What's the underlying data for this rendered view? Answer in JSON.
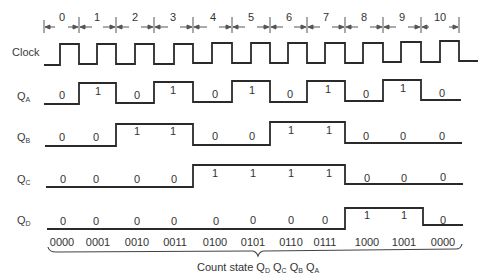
{
  "diagram": {
    "type": "timing-diagram",
    "title": "",
    "signals": {
      "clock": {
        "label": "Clock"
      },
      "qa": {
        "label": "Q",
        "sub": "A",
        "values": [
          "0",
          "1",
          "0",
          "1",
          "0",
          "1",
          "0",
          "1",
          "0",
          "1",
          "0"
        ]
      },
      "qb": {
        "label": "Q",
        "sub": "B",
        "values": [
          "0",
          "0",
          "1",
          "1",
          "0",
          "0",
          "1",
          "1",
          "0",
          "0",
          "0"
        ]
      },
      "qc": {
        "label": "Q",
        "sub": "C",
        "values": [
          "0",
          "0",
          "0",
          "0",
          "1",
          "1",
          "1",
          "1",
          "0",
          "0",
          "0"
        ]
      },
      "qd": {
        "label": "Q",
        "sub": "D",
        "values": [
          "0",
          "0",
          "0",
          "0",
          "0",
          "0",
          "0",
          "0",
          "1",
          "1",
          "0"
        ]
      }
    },
    "periods": [
      "0",
      "1",
      "2",
      "3",
      "4",
      "5",
      "6",
      "7",
      "8",
      "9",
      "10"
    ],
    "count_states": [
      "0000",
      "0001",
      "0010",
      "0011",
      "0100",
      "0101",
      "0110",
      "0111",
      "1000",
      "1001",
      "0000"
    ],
    "caption": {
      "text": "Count state",
      "bits": [
        {
          "q": "Q",
          "sub": "D"
        },
        {
          "q": "Q",
          "sub": "C"
        },
        {
          "q": "Q",
          "sub": "B"
        },
        {
          "q": "Q",
          "sub": "A"
        }
      ]
    },
    "line_color": "#2a2a2a"
  }
}
